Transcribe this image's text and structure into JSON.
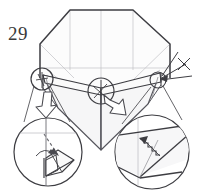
{
  "figure": {
    "step_number": "29",
    "type": "origami-fold-diagram",
    "caption": "",
    "colors": {
      "outline": "#3d3d42",
      "crease": "#b9b9bd",
      "fold_edge": "#55555c",
      "arrow_outline": "#4a4a50",
      "dashed_arrow": "#6a6a70",
      "background": "#ffffff",
      "facet_light": "#fbfbfb",
      "facet_shade": "#f4f4f5"
    },
    "elements": {
      "main_shape": "octagon",
      "detail_circles": 2,
      "callout_circles": 3,
      "fold_arrows": 3,
      "repeat_mark": "x-cross-repeat-symbol",
      "pleat_pattern": "zigzag-crimp"
    }
  }
}
